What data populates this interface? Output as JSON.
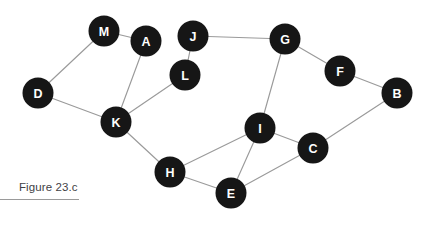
{
  "figure": {
    "caption": "Figure 23.c",
    "caption_rule": true
  },
  "style": {
    "node_fill": "#161616",
    "node_label_color": "#ffffff",
    "edge_color": "#9a9a9a",
    "background": "#ffffff",
    "caption_color": "#3f3f46",
    "node_radius": 15.5
  },
  "chart_data": {
    "type": "diagram",
    "title": "Figure 23.c",
    "graph_kind": "undirected-node-link-graph",
    "node_count": 13,
    "edge_count": 17,
    "nodes": [
      {
        "id": "M",
        "label": "M",
        "x": 104,
        "y": 31
      },
      {
        "id": "A",
        "label": "A",
        "x": 146,
        "y": 41
      },
      {
        "id": "J",
        "label": "J",
        "x": 193,
        "y": 36
      },
      {
        "id": "G",
        "label": "G",
        "x": 285,
        "y": 39
      },
      {
        "id": "F",
        "label": "F",
        "x": 340,
        "y": 71
      },
      {
        "id": "B",
        "label": "B",
        "x": 397,
        "y": 93
      },
      {
        "id": "D",
        "label": "D",
        "x": 38,
        "y": 93
      },
      {
        "id": "L",
        "label": "L",
        "x": 185,
        "y": 75
      },
      {
        "id": "K",
        "label": "K",
        "x": 116,
        "y": 122
      },
      {
        "id": "I",
        "label": "I",
        "x": 260,
        "y": 128
      },
      {
        "id": "C",
        "label": "C",
        "x": 313,
        "y": 148
      },
      {
        "id": "H",
        "label": "H",
        "x": 170,
        "y": 172
      },
      {
        "id": "E",
        "label": "E",
        "x": 231,
        "y": 193
      }
    ],
    "edges": [
      {
        "source": "M",
        "target": "A"
      },
      {
        "source": "M",
        "target": "D"
      },
      {
        "source": "D",
        "target": "K"
      },
      {
        "source": "A",
        "target": "K"
      },
      {
        "source": "K",
        "target": "L"
      },
      {
        "source": "L",
        "target": "J"
      },
      {
        "source": "J",
        "target": "G"
      },
      {
        "source": "G",
        "target": "F"
      },
      {
        "source": "F",
        "target": "B"
      },
      {
        "source": "G",
        "target": "I"
      },
      {
        "source": "I",
        "target": "H"
      },
      {
        "source": "I",
        "target": "E"
      },
      {
        "source": "I",
        "target": "C"
      },
      {
        "source": "K",
        "target": "H"
      },
      {
        "source": "H",
        "target": "E"
      },
      {
        "source": "E",
        "target": "C"
      },
      {
        "source": "C",
        "target": "B"
      }
    ]
  }
}
